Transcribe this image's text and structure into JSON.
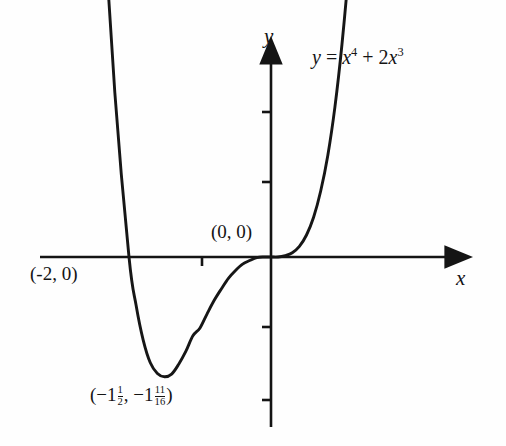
{
  "chart_data": {
    "type": "line",
    "title": "",
    "xlabel": "x",
    "ylabel": "y",
    "equation_text": "y = x^4 + 2x^3",
    "equation_parts": {
      "lhs": "y",
      "equals": "=",
      "term1_base": "x",
      "term1_exp": "4",
      "plus": "+",
      "term2_coeff": "2",
      "term2_base": "x",
      "term2_exp": "3"
    },
    "grid": false,
    "legend": false,
    "xlim": [
      -2.9,
      1.75
    ],
    "ylim": [
      -2.6,
      4.6
    ],
    "annotations": [
      {
        "name": "x-intercept",
        "label": "(-2, 0)",
        "x": -2,
        "y": 0
      },
      {
        "name": "origin",
        "label": "(0, 0)",
        "x": 0,
        "y": 0
      },
      {
        "name": "minimum",
        "label": "(-1 1/2, -1 11/16)",
        "x": -1.5,
        "y": -1.6875
      }
    ],
    "minimum_label_parts": {
      "open": "(",
      "x_sign": "−",
      "x_whole": "1",
      "x_num": "1",
      "x_den": "2",
      "comma": ",",
      "y_sign": "−",
      "y_whole": "1",
      "y_num": "11",
      "y_den": "16",
      "close": ")"
    },
    "x": [
      -2.55,
      -2.4,
      -2.2,
      -2.0,
      -1.9,
      -1.8,
      -1.7,
      -1.6,
      -1.5,
      -1.4,
      -1.3,
      -1.2,
      -1.1,
      -1.0,
      -0.9,
      -0.8,
      -0.7,
      -0.6,
      -0.5,
      -0.4,
      -0.3,
      -0.2,
      -0.1,
      0.0,
      0.1,
      0.2,
      0.3,
      0.4,
      0.5,
      0.6,
      0.7,
      0.8,
      0.9,
      1.0,
      1.1,
      1.2,
      1.25
    ],
    "y": [
      8.07,
      5.53,
      2.32,
      0.0,
      -0.68,
      -1.17,
      -1.49,
      -1.64,
      -1.6875,
      -1.65,
      -1.51,
      -1.33,
      -1.11,
      -1.0,
      -0.8,
      -0.61,
      -0.45,
      -0.3,
      -0.19,
      -0.1,
      -0.05,
      -0.01,
      0.0,
      0.0,
      0.0,
      0.02,
      0.06,
      0.15,
      0.31,
      0.56,
      0.93,
      1.43,
      2.11,
      3.0,
      4.12,
      5.53,
      6.35
    ]
  },
  "axes": {
    "y_axis_name": "y",
    "x_axis_name": "x",
    "y_ticks_above_origin": 2,
    "y_ticks_below_origin": 2,
    "x_ticks_left_of_origin": 1,
    "x_ticks_right_of_origin": 0
  }
}
